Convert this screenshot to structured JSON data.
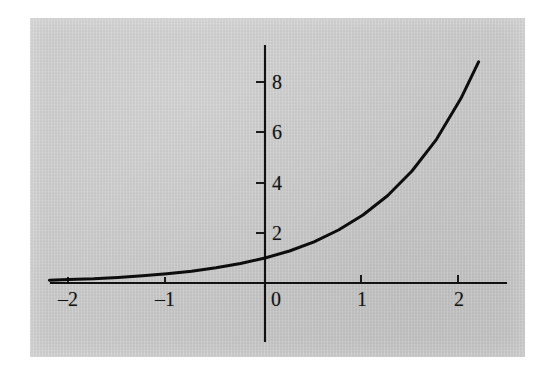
{
  "figure": {
    "kind": "mathematical-function-plot",
    "background_color": "#c9c9c9",
    "page_color": "#ffffff",
    "curve_color": "#0d0d0d",
    "axis_color": "#111111"
  },
  "chart_data": {
    "type": "line",
    "title": "",
    "subtitle": "",
    "xlabel": "",
    "ylabel": "",
    "function": "y = e^x",
    "grid": false,
    "legend": null,
    "legend_position": "none",
    "xlim": [
      -2.2,
      2.45
    ],
    "ylim": [
      -1.5,
      9.6
    ],
    "x_ticks": [
      -2,
      -1,
      1,
      2
    ],
    "x_tick_labels": [
      "–2",
      "–1",
      "1",
      "2"
    ],
    "y_ticks": [
      2,
      4,
      6,
      8
    ],
    "y_tick_labels": [
      "2",
      "4",
      "6",
      "8"
    ],
    "origin_label": "0",
    "annotations": [],
    "series": [
      {
        "name": "y = e^x",
        "x": [
          -2.2,
          -2.0,
          -1.75,
          -1.5,
          -1.25,
          -1.0,
          -0.75,
          -0.5,
          -0.25,
          0.0,
          0.25,
          0.5,
          0.75,
          1.0,
          1.25,
          1.5,
          1.75,
          2.0,
          2.18
        ],
        "values": [
          0.11,
          0.14,
          0.17,
          0.22,
          0.29,
          0.37,
          0.47,
          0.61,
          0.78,
          1.0,
          1.28,
          1.65,
          2.12,
          2.72,
          3.49,
          4.48,
          5.75,
          7.39,
          8.85
        ]
      }
    ]
  },
  "labels": {
    "x_minus_two": "–2",
    "x_minus_one": "–1",
    "x_zero": "0",
    "x_one": "1",
    "x_two": "2",
    "y_two": "2",
    "y_four": "4",
    "y_six": "6",
    "y_eight": "8"
  }
}
